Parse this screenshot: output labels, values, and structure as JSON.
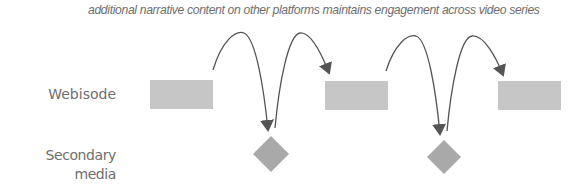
{
  "caption": "additional narrative content on other platforms maintains engagement across video series",
  "rows": {
    "webisode": {
      "label": "Webisode"
    },
    "secondary": {
      "label_line1": "Secondary media",
      "label_line2": "(less expensive)"
    }
  },
  "colors": {
    "text": "#6e6e6e",
    "webisode_fill": "#c6c6c6",
    "secondary_fill": "#a9a9a9",
    "arrow": "#555555"
  },
  "nodes": {
    "webisodes": [
      {
        "id": "webisode-1",
        "x": 150,
        "y": 80,
        "w": 63,
        "h": 29
      },
      {
        "id": "webisode-2",
        "x": 325,
        "y": 81,
        "w": 63,
        "h": 29
      },
      {
        "id": "webisode-3",
        "x": 498,
        "y": 81,
        "w": 63,
        "h": 29
      }
    ],
    "secondary_media": [
      {
        "id": "secondary-1",
        "cx": 271,
        "cy": 154,
        "r": 18
      },
      {
        "id": "secondary-2",
        "cx": 444,
        "cy": 157,
        "r": 17
      }
    ]
  },
  "arrows": [
    {
      "from": "webisode-1",
      "to": "secondary-1"
    },
    {
      "from": "secondary-1",
      "to": "webisode-2"
    },
    {
      "from": "webisode-2",
      "to": "secondary-2"
    },
    {
      "from": "secondary-2",
      "to": "webisode-3"
    }
  ]
}
